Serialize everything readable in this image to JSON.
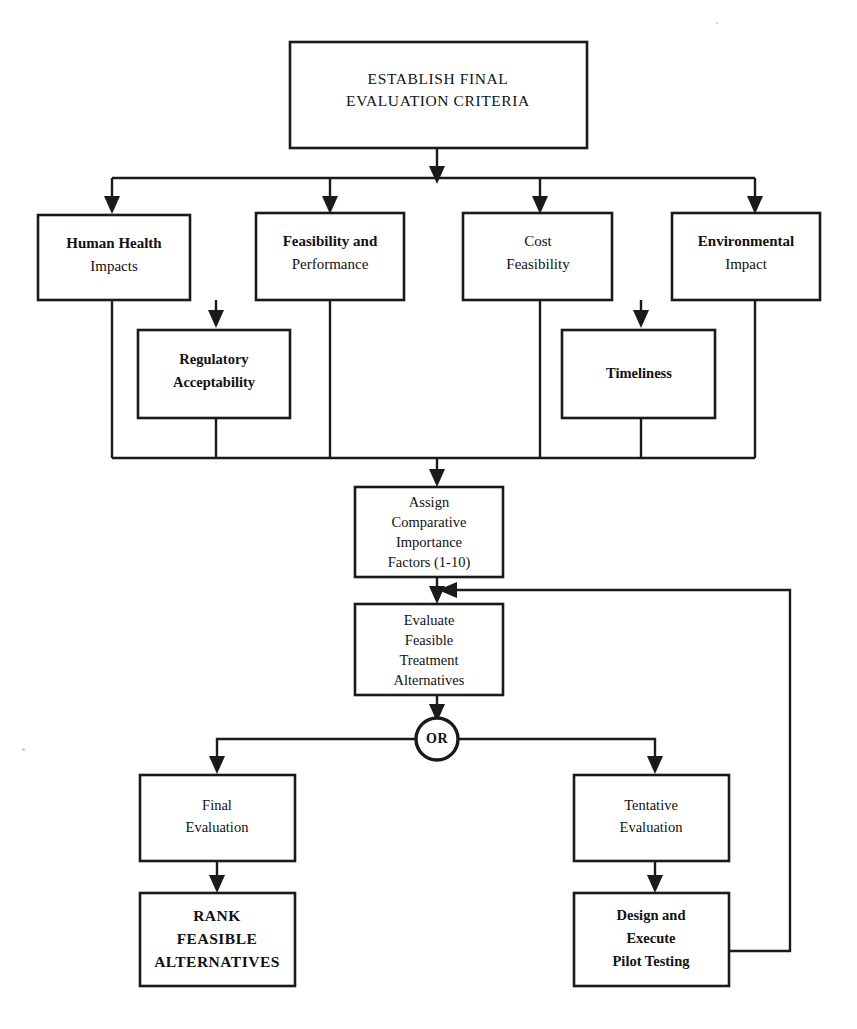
{
  "diagram": {
    "colors": {
      "line": "#1a1a1a",
      "box_fill": "#ffffff",
      "text": "#111111",
      "background": "#ffffff"
    },
    "nodes": {
      "establish": {
        "id": "establish-final-evaluation-criteria",
        "lines": [
          "ESTABLISH FINAL",
          "EVALUATION CRITERIA"
        ],
        "style": "caps"
      },
      "human_health": {
        "id": "human-health-impacts",
        "lines": [
          "Human Health",
          "Impacts"
        ],
        "emphasis": [
          "bold",
          "regular"
        ]
      },
      "feasibility_performance": {
        "id": "feasibility-and-performance",
        "lines": [
          "Feasibility and",
          "Performance"
        ],
        "emphasis": [
          "bold",
          "regular"
        ]
      },
      "cost_feasibility": {
        "id": "cost-feasibility",
        "lines": [
          "Cost",
          "Feasibility"
        ],
        "emphasis": [
          "regular",
          "regular"
        ]
      },
      "environmental_impact": {
        "id": "environmental-impact",
        "lines": [
          "Environmental",
          "Impact"
        ],
        "emphasis": [
          "bold",
          "regular"
        ]
      },
      "regulatory": {
        "id": "regulatory-acceptability",
        "lines": [
          "Regulatory",
          "Acceptability"
        ],
        "emphasis": [
          "bold",
          "bold"
        ]
      },
      "timeliness": {
        "id": "timeliness",
        "lines": [
          "Timeliness"
        ],
        "emphasis": [
          "bold"
        ]
      },
      "assign": {
        "id": "assign-comparative-importance-factors",
        "lines": [
          "Assign",
          "Comparative",
          "Importance",
          "Factors (1-10)"
        ],
        "emphasis": [
          "regular",
          "regular",
          "regular",
          "regular"
        ]
      },
      "evaluate": {
        "id": "evaluate-feasible-treatment-alternatives",
        "lines": [
          "Evaluate",
          "Feasible",
          "Treatment",
          "Alternatives"
        ],
        "emphasis": [
          "regular",
          "regular",
          "regular",
          "regular"
        ]
      },
      "or_gate": {
        "id": "or-decision",
        "label": "OR"
      },
      "final_evaluation": {
        "id": "final-evaluation",
        "lines": [
          "Final",
          "Evaluation"
        ],
        "emphasis": [
          "regular",
          "regular"
        ]
      },
      "tentative_evaluation": {
        "id": "tentative-evaluation",
        "lines": [
          "Tentative",
          "Evaluation"
        ],
        "emphasis": [
          "regular",
          "regular"
        ]
      },
      "rank": {
        "id": "rank-feasible-alternatives",
        "lines": [
          "RANK",
          "FEASIBLE",
          "ALTERNATIVES"
        ],
        "style": "caps-bold"
      },
      "pilot": {
        "id": "design-and-execute-pilot-testing",
        "lines": [
          "Design and",
          "Execute",
          "Pilot Testing"
        ],
        "emphasis": [
          "bold",
          "bold",
          "bold"
        ]
      }
    },
    "edges": [
      {
        "from": "establish",
        "to": "distribution-bus",
        "type": "arrow-down"
      },
      {
        "from": "distribution-bus",
        "to": "human_health",
        "type": "arrow-down"
      },
      {
        "from": "distribution-bus",
        "to": "feasibility_performance",
        "type": "arrow-down"
      },
      {
        "from": "distribution-bus",
        "to": "cost_feasibility",
        "type": "arrow-down"
      },
      {
        "from": "distribution-bus",
        "to": "environmental_impact",
        "type": "arrow-down"
      },
      {
        "from": "human_health",
        "to": "regulatory",
        "type": "arrow-down"
      },
      {
        "from": "cost_feasibility",
        "to": "timeliness",
        "type": "arrow-down"
      },
      {
        "from": "collection-bus",
        "to": "assign",
        "type": "arrow-down"
      },
      {
        "from": "assign",
        "to": "evaluate",
        "type": "arrow-down"
      },
      {
        "from": "evaluate",
        "to": "or_gate",
        "type": "arrow-down"
      },
      {
        "from": "or_gate",
        "to": "final_evaluation",
        "type": "arrow-down"
      },
      {
        "from": "or_gate",
        "to": "tentative_evaluation",
        "type": "arrow-down"
      },
      {
        "from": "final_evaluation",
        "to": "rank",
        "type": "arrow-down"
      },
      {
        "from": "tentative_evaluation",
        "to": "pilot",
        "type": "arrow-down"
      },
      {
        "from": "pilot",
        "to": "evaluate",
        "type": "feedback-loop-arrow-left"
      }
    ]
  }
}
